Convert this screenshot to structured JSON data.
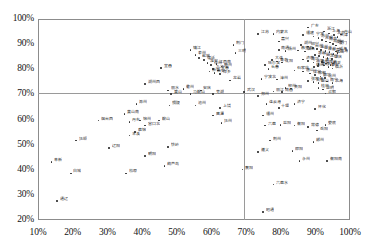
{
  "chart_data": {
    "type": "scatter",
    "title": "",
    "xlabel": "",
    "ylabel": "",
    "xlim": [
      10,
      100
    ],
    "ylim": [
      20,
      100
    ],
    "grid": false,
    "legend": "none",
    "xticks": [
      "10%",
      "20%",
      "30%",
      "40%",
      "50%",
      "60%",
      "70%",
      "80%",
      "90%",
      "100%"
    ],
    "yticks": [
      "20%",
      "30%",
      "40%",
      "50%",
      "60%",
      "70%",
      "80%",
      "90%",
      "100%"
    ],
    "xtick_values": [
      10,
      20,
      30,
      40,
      50,
      60,
      70,
      80,
      90,
      100
    ],
    "ytick_values": [
      20,
      30,
      40,
      50,
      60,
      70,
      80,
      90,
      100
    ],
    "reference_lines": [
      {
        "orientation": "vertical",
        "value": 69.5,
        "color": "#9a9a9a"
      },
      {
        "orientation": "horizontal",
        "value": 70.5,
        "color": "#9a9a9a"
      }
    ],
    "marker_color": "#2b2b2b",
    "points": [
      {
        "label": "广东",
        "x": 88.0,
        "y": 96.5
      },
      {
        "label": "江苏",
        "x": 73.5,
        "y": 94.0
      },
      {
        "label": "内蒙古",
        "x": 78.0,
        "y": 94.0
      },
      {
        "label": "浙江",
        "x": 92.5,
        "y": 95.0
      },
      {
        "label": "上海",
        "x": 94.0,
        "y": 94.2
      },
      {
        "label": "北京",
        "x": 95.5,
        "y": 93.5
      },
      {
        "label": "天津",
        "x": 96.5,
        "y": 92.8
      },
      {
        "label": "舟山",
        "x": 97.5,
        "y": 93.8
      },
      {
        "label": "福建",
        "x": 86.5,
        "y": 93.5
      },
      {
        "label": "宁波",
        "x": 89.5,
        "y": 93.0
      },
      {
        "label": "苏州",
        "x": 91.0,
        "y": 92.3
      },
      {
        "label": "无锡",
        "x": 92.0,
        "y": 91.5
      },
      {
        "label": "南京",
        "x": 93.2,
        "y": 91.0
      },
      {
        "label": "常州",
        "x": 94.3,
        "y": 90.5
      },
      {
        "label": "深圳",
        "x": 95.2,
        "y": 90.0
      },
      {
        "label": "厦门",
        "x": 96.0,
        "y": 89.4
      },
      {
        "label": "嘉兴",
        "x": 79.5,
        "y": 91.0
      },
      {
        "label": "湖州",
        "x": 86.0,
        "y": 89.5
      },
      {
        "label": "绍兴",
        "x": 88.0,
        "y": 89.0
      },
      {
        "label": "台州",
        "x": 89.3,
        "y": 88.4
      },
      {
        "label": "温州",
        "x": 90.5,
        "y": 88.0
      },
      {
        "label": "金华",
        "x": 91.7,
        "y": 87.6
      },
      {
        "label": "泉州",
        "x": 93.0,
        "y": 87.2
      },
      {
        "label": "东莞",
        "x": 94.2,
        "y": 86.8
      },
      {
        "label": "珠海",
        "x": 96.5,
        "y": 86.5
      },
      {
        "label": "佛山",
        "x": 95.3,
        "y": 86.0
      },
      {
        "label": "惠州",
        "x": 90.0,
        "y": 85.6
      },
      {
        "label": "中山",
        "x": 91.2,
        "y": 85.2
      },
      {
        "label": "汕头",
        "x": 92.4,
        "y": 84.8
      },
      {
        "label": "江门",
        "x": 93.6,
        "y": 84.4
      },
      {
        "label": "肇庆",
        "x": 94.8,
        "y": 84.0
      },
      {
        "label": "湛江",
        "x": 92.0,
        "y": 82.8
      },
      {
        "label": "茂名",
        "x": 93.2,
        "y": 82.2
      },
      {
        "label": "韶关",
        "x": 94.4,
        "y": 81.6
      },
      {
        "label": "清远",
        "x": 90.8,
        "y": 81.2
      },
      {
        "label": "梅州",
        "x": 89.6,
        "y": 80.8
      },
      {
        "label": "南通",
        "x": 79.5,
        "y": 87.5
      },
      {
        "label": "扬州",
        "x": 81.5,
        "y": 87.2
      },
      {
        "label": "秦皇岛",
        "x": 85.0,
        "y": 87.4
      },
      {
        "label": "烟台",
        "x": 87.0,
        "y": 87.0
      },
      {
        "label": "威海",
        "x": 96.0,
        "y": 87.0
      },
      {
        "label": "大连",
        "x": 77.5,
        "y": 83.5
      },
      {
        "label": "青岛",
        "x": 79.0,
        "y": 83.0
      },
      {
        "label": "沈阳",
        "x": 80.5,
        "y": 82.6
      },
      {
        "label": "济南",
        "x": 86.5,
        "y": 83.8
      },
      {
        "label": "潍坊",
        "x": 88.0,
        "y": 83.2
      },
      {
        "label": "淄博",
        "x": 89.5,
        "y": 82.6
      },
      {
        "label": "日照",
        "x": 91.0,
        "y": 82.0
      },
      {
        "label": "东营",
        "x": 92.5,
        "y": 81.4
      },
      {
        "label": "泰安",
        "x": 93.8,
        "y": 80.8
      },
      {
        "label": "临沂",
        "x": 95.0,
        "y": 80.2
      },
      {
        "label": "哈尔滨",
        "x": 75.5,
        "y": 81.5
      },
      {
        "label": "长春",
        "x": 76.5,
        "y": 80.0
      },
      {
        "label": "石家庄",
        "x": 84.0,
        "y": 79.5
      },
      {
        "label": "唐山",
        "x": 86.5,
        "y": 79.0
      },
      {
        "label": "保定",
        "x": 88.5,
        "y": 78.2
      },
      {
        "label": "邯郸",
        "x": 90.0,
        "y": 77.6
      },
      {
        "label": "廊坊",
        "x": 91.5,
        "y": 77.0
      },
      {
        "label": "沧州",
        "x": 92.8,
        "y": 76.5
      },
      {
        "label": "张家港",
        "x": 88.0,
        "y": 75.2
      },
      {
        "label": "太仓",
        "x": 89.5,
        "y": 74.8
      },
      {
        "label": "昆山",
        "x": 91.0,
        "y": 74.4
      },
      {
        "label": "宁波北",
        "x": 74.5,
        "y": 76.0
      },
      {
        "label": "漳州",
        "x": 79.0,
        "y": 75.8
      },
      {
        "label": "南宁",
        "x": 93.5,
        "y": 75.0
      },
      {
        "label": "北海",
        "x": 95.0,
        "y": 74.5
      },
      {
        "label": "柳州",
        "x": 81.5,
        "y": 72.5
      },
      {
        "label": "贵阳",
        "x": 83.0,
        "y": 72.2
      },
      {
        "label": "桂林",
        "x": 91.0,
        "y": 72.4
      },
      {
        "label": "昆明",
        "x": 92.3,
        "y": 71.8
      },
      {
        "label": "丽江",
        "x": 78.0,
        "y": 71.0
      },
      {
        "label": "南昌",
        "x": 80.5,
        "y": 70.8
      },
      {
        "label": "合肥",
        "x": 93.0,
        "y": 70.2
      },
      {
        "label": "武汉",
        "x": 69.5,
        "y": 70.8
      },
      {
        "label": "郑州",
        "x": 73.5,
        "y": 69.2
      },
      {
        "label": "连云港",
        "x": 76.0,
        "y": 66.0
      },
      {
        "label": "济宁",
        "x": 84.0,
        "y": 66.2
      },
      {
        "label": "十堰",
        "x": 79.5,
        "y": 64.5
      },
      {
        "label": "怀化",
        "x": 90.0,
        "y": 64.0
      },
      {
        "label": "福州",
        "x": 75.0,
        "y": 61.5
      },
      {
        "label": "六盘",
        "x": 75.5,
        "y": 57.5
      },
      {
        "label": "益阳",
        "x": 80.0,
        "y": 57.8
      },
      {
        "label": "衡阳",
        "x": 84.0,
        "y": 57.5
      },
      {
        "label": "常德",
        "x": 88.0,
        "y": 57.0
      },
      {
        "label": "娄底",
        "x": 93.0,
        "y": 57.8
      },
      {
        "label": "岳阳",
        "x": 90.5,
        "y": 55.5
      },
      {
        "label": "荆州",
        "x": 77.0,
        "y": 51.5
      },
      {
        "label": "郴州",
        "x": 89.5,
        "y": 51.0
      },
      {
        "label": "遵义",
        "x": 73.5,
        "y": 47.0
      },
      {
        "label": "邵阳",
        "x": 83.5,
        "y": 47.5
      },
      {
        "label": "永州",
        "x": 85.5,
        "y": 43.5
      },
      {
        "label": "衡阳南",
        "x": 93.5,
        "y": 43.5
      },
      {
        "label": "六盘水",
        "x": 78.0,
        "y": 34.0
      },
      {
        "label": "昭通",
        "x": 75.0,
        "y": 23.0
      },
      {
        "label": "襄阳",
        "x": 69.0,
        "y": 40.0
      },
      {
        "label": "荆门",
        "x": 66.5,
        "y": 89.5
      },
      {
        "label": "三明",
        "x": 67.0,
        "y": 86.5
      },
      {
        "label": "龙岩",
        "x": 65.5,
        "y": 75.5
      },
      {
        "label": "镇江",
        "x": 54.0,
        "y": 87.5
      },
      {
        "label": "泰州",
        "x": 55.5,
        "y": 85.5
      },
      {
        "label": "盐城",
        "x": 56.5,
        "y": 84.5
      },
      {
        "label": "宿迁",
        "x": 58.0,
        "y": 83.5
      },
      {
        "label": "淮安",
        "x": 59.0,
        "y": 82.5
      },
      {
        "label": "徐州",
        "x": 60.0,
        "y": 81.5
      },
      {
        "label": "江西南",
        "x": 61.5,
        "y": 82.0
      },
      {
        "label": "赣州",
        "x": 63.0,
        "y": 81.0
      },
      {
        "label": "九江",
        "x": 60.5,
        "y": 80.0
      },
      {
        "label": "宜春",
        "x": 62.0,
        "y": 79.5
      },
      {
        "label": "新余",
        "x": 59.5,
        "y": 79.0
      },
      {
        "label": "吉安",
        "x": 61.0,
        "y": 78.5
      },
      {
        "label": "萍乡",
        "x": 62.5,
        "y": 78.0
      },
      {
        "label": "宜昌",
        "x": 45.5,
        "y": 80.5
      },
      {
        "label": "湖州西",
        "x": 41.0,
        "y": 74.0
      },
      {
        "label": "丽水",
        "x": 47.5,
        "y": 71.5
      },
      {
        "label": "衢州",
        "x": 52.0,
        "y": 72.0
      },
      {
        "label": "安庆",
        "x": 57.0,
        "y": 71.5
      },
      {
        "label": "黄山",
        "x": 48.5,
        "y": 70.0
      },
      {
        "label": "马鞍山",
        "x": 54.0,
        "y": 70.0
      },
      {
        "label": "芜湖",
        "x": 60.5,
        "y": 70.0
      },
      {
        "label": "滁州",
        "x": 38.5,
        "y": 66.0
      },
      {
        "label": "铜陵",
        "x": 48.0,
        "y": 65.5
      },
      {
        "label": "池州",
        "x": 55.5,
        "y": 65.5
      },
      {
        "label": "上饶",
        "x": 62.5,
        "y": 64.5
      },
      {
        "label": "鹰潭",
        "x": 60.5,
        "y": 61.5
      },
      {
        "label": "抚州",
        "x": 63.0,
        "y": 58.5
      },
      {
        "label": "黄山南",
        "x": 35.0,
        "y": 62.0
      },
      {
        "label": "烟台西",
        "x": 27.5,
        "y": 59.5
      },
      {
        "label": "丹东",
        "x": 36.5,
        "y": 59.0
      },
      {
        "label": "锦州",
        "x": 39.5,
        "y": 59.5
      },
      {
        "label": "鞍山",
        "x": 45.0,
        "y": 59.5
      },
      {
        "label": "营口北",
        "x": 41.0,
        "y": 57.5
      },
      {
        "label": "盘锦",
        "x": 38.0,
        "y": 55.0
      },
      {
        "label": "本溪",
        "x": 36.5,
        "y": 53.5
      },
      {
        "label": "抚顺",
        "x": 21.0,
        "y": 51.5
      },
      {
        "label": "辽阳",
        "x": 30.5,
        "y": 48.5
      },
      {
        "label": "铁岭",
        "x": 47.5,
        "y": 49.0
      },
      {
        "label": "朝阳",
        "x": 41.0,
        "y": 45.5
      },
      {
        "label": "阜新",
        "x": 14.0,
        "y": 43.0
      },
      {
        "label": "葫芦岛",
        "x": 46.5,
        "y": 41.5
      },
      {
        "label": "白城",
        "x": 19.5,
        "y": 38.5
      },
      {
        "label": "松原",
        "x": 35.5,
        "y": 38.5
      },
      {
        "label": "通辽",
        "x": 15.5,
        "y": 27.5
      }
    ]
  }
}
